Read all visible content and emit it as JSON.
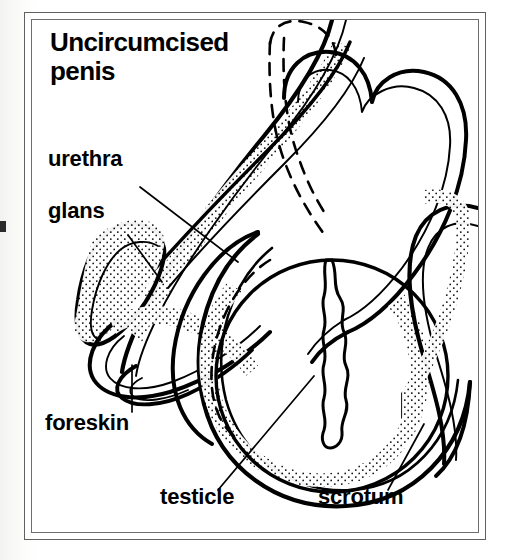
{
  "figure": {
    "title": "Uncircumcised penis",
    "title_lines": [
      "Uncircumcised",
      "penis"
    ],
    "kind": "anatomical line drawing",
    "ink_color": "#000000",
    "frame_color": "#5e6062",
    "paper_color": "#ffffff"
  },
  "labels": {
    "title": "Uncircumcised penis",
    "urethra": "urethra",
    "glans": "glans",
    "foreskin": "foreskin",
    "testicle": "testicle",
    "scrotum": "scrotum"
  },
  "parts": [
    {
      "name": "urethra",
      "label": "urethra",
      "leader": "diagonal line running down-right from label into the shaft channel"
    },
    {
      "name": "glans",
      "label": "glans",
      "leader": "short diagonal line down-right from label to the bulbous tip"
    },
    {
      "name": "foreskin",
      "label": "foreskin",
      "leader": "vertical line up from label to the folded skin tip"
    },
    {
      "name": "testicle",
      "label": "testicle",
      "leader": "diagonal line up-right from label into the testicle oval"
    },
    {
      "name": "scrotum",
      "label": "scrotum",
      "leader": "diagonal line up-right from label to the scrotal wall"
    }
  ],
  "render": {
    "width": 510,
    "height": 560,
    "stroke_width_outline": 3.6,
    "stroke_width_inner": 1.8,
    "stroke_width_leader": 1.6,
    "dash_pattern": "11 8"
  }
}
